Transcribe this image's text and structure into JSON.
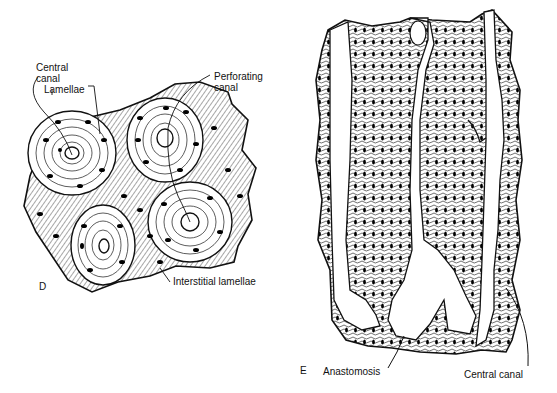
{
  "figure": {
    "panels": [
      {
        "id": "D",
        "letter": "D",
        "description": "Transverse section of compact bone showing osteons",
        "labels": {
          "central_canal": "Central\ncanal",
          "central_canal_line1": "Central",
          "central_canal_line2": "canal",
          "lamellae": "Lamellae",
          "perforating_canal_line1": "Perforating",
          "perforating_canal_line2": "canal",
          "interstitial_lamellae": "Interstitial  lamellae"
        }
      },
      {
        "id": "E",
        "letter": "E",
        "description": "Longitudinal section of compact bone showing central canals",
        "labels": {
          "anastomosis": "Anastomosis",
          "central_canal": "Central  canal"
        }
      }
    ],
    "colors": {
      "ink": "#111111",
      "paper": "#ffffff"
    }
  }
}
